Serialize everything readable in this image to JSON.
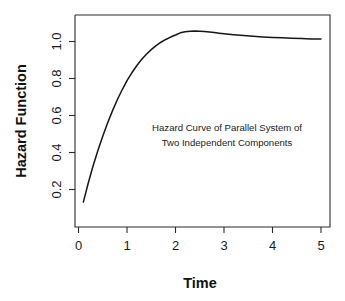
{
  "figure": {
    "background_color": "#ffffff",
    "curve_color": "#161616",
    "axis_color": "#2b2b2b"
  },
  "annotation": {
    "line1": "Hazard Curve of Parallel System of",
    "line2": "Two Independent Components"
  },
  "axes": {
    "x_title": "Time",
    "y_title": "Hazard Function",
    "x_tick_labels": [
      "0",
      "1",
      "2",
      "3",
      "4",
      "5"
    ],
    "y_tick_labels": [
      "0.2",
      "0.4",
      "0.6",
      "0.8",
      "1.0"
    ]
  },
  "chart_data": {
    "type": "line",
    "title": "",
    "subtitle": "",
    "xlabel": "Time",
    "ylabel": "Hazard Function",
    "annotations": [
      "Hazard Curve of Parallel System of",
      "Two Independent Components"
    ],
    "grid": false,
    "legend": null,
    "xlim": [
      0,
      5.2
    ],
    "ylim": [
      0.1,
      1.1
    ],
    "xticks": [
      0,
      1,
      2,
      3,
      4,
      5
    ],
    "yticks": [
      0.2,
      0.4,
      0.6,
      0.8,
      1.0
    ],
    "series": [
      {
        "name": "Hazard function of parallel system",
        "x": [
          0.1,
          0.2,
          0.3,
          0.4,
          0.5,
          0.6,
          0.7,
          0.8,
          0.9,
          1.0,
          1.1,
          1.2,
          1.3,
          1.4,
          1.5,
          1.6,
          1.7,
          1.8,
          1.9,
          2.0,
          2.1,
          2.2,
          2.3,
          2.4,
          2.5,
          2.6,
          2.7,
          2.8,
          2.9,
          3.0,
          3.2,
          3.4,
          3.6,
          3.8,
          4.0,
          4.2,
          4.4,
          4.6,
          4.8,
          5.0
        ],
        "y": [
          0.132,
          0.234,
          0.327,
          0.411,
          0.488,
          0.559,
          0.625,
          0.685,
          0.739,
          0.788,
          0.831,
          0.869,
          0.903,
          0.931,
          0.956,
          0.978,
          0.996,
          1.011,
          1.024,
          1.035,
          1.047,
          1.053,
          1.056,
          1.057,
          1.056,
          1.054,
          1.051,
          1.048,
          1.045,
          1.042,
          1.037,
          1.032,
          1.028,
          1.025,
          1.022,
          1.02,
          1.018,
          1.016,
          1.014,
          1.013
        ]
      }
    ]
  }
}
